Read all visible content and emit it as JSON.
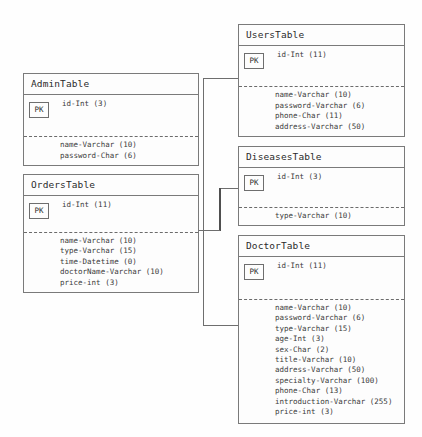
{
  "diagram": {
    "pk_badge_label": "PK",
    "line_color": "#6e6e6e",
    "box_border_color": "#7a7a7a",
    "text_color": "#3a3a3a",
    "background_color": "#fefefe"
  },
  "tables": {
    "admin": {
      "name": "AdminTable",
      "pk": "id-Int (3)",
      "attributes": [
        "name-Varchar (10)",
        "password-Char (6)"
      ]
    },
    "orders": {
      "name": "OrdersTable",
      "pk": "id-Int (11)",
      "attributes": [
        "name-Varchar (10)",
        "type-Varchar (15)",
        "time-Datetime (0)",
        "doctorName-Varchar (10)",
        "price-int (3)"
      ]
    },
    "users": {
      "name": "UsersTable",
      "pk": "id-Int (11)",
      "attributes": [
        "name-Varchar (10)",
        "password-Varchar (6)",
        "phone-Char (11)",
        "address-Varchar (50)"
      ]
    },
    "diseases": {
      "name": "DiseasesTable",
      "pk": "id-Int (3)",
      "attributes": [
        "type-Varchar (10)"
      ]
    },
    "doctor": {
      "name": "DoctorTable",
      "pk": "id-Int (11)",
      "attributes": [
        "name-Varchar (10)",
        "password-Varchar (6)",
        "type-Varchar (15)",
        "age-Int (3)",
        "sex-Char (2)",
        "title-Varchar (10)",
        "address-Varchar (50)",
        "specialty-Varchar (100)",
        "phone-Char (13)",
        "introduction-Varchar (255)",
        "price-int (3)"
      ]
    }
  },
  "relationships": [
    {
      "from": "UsersTable",
      "to": "OrdersTable",
      "style": "solid-line-arrow"
    },
    {
      "from": "DiseasesTable",
      "to": "OrdersTable",
      "style": "solid-line-arrow"
    },
    {
      "from": "DoctorTable",
      "to": "OrdersTable",
      "style": "solid-line-arrow"
    }
  ]
}
